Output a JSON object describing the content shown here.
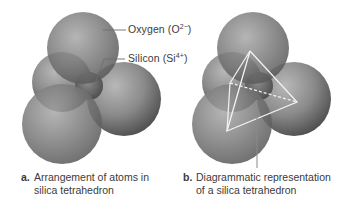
{
  "figure": {
    "panel_a": {
      "labels": {
        "oxygen": {
          "text": "Oxygen (O",
          "sup": "2−",
          "close": ")"
        },
        "silicon": {
          "text": "Silicon (Si",
          "sup": "4+",
          "close": ")"
        }
      },
      "caption": {
        "letter": "a.",
        "line1": "Arrangement of atoms in",
        "line2": "silica tetrahedron"
      }
    },
    "panel_b": {
      "caption": {
        "letter": "b.",
        "line1": "Diagrammatic representation",
        "line2": "of a silica tetrahedron"
      }
    },
    "colors": {
      "sphere_light": "#b4b4b4",
      "sphere_mid": "#7d7d7d",
      "sphere_dark": "#4a4a4a",
      "leader_line": "#6e6e6e",
      "tetrahedron_edge": "#f2f2f2",
      "text": "#3b3b3b"
    }
  }
}
